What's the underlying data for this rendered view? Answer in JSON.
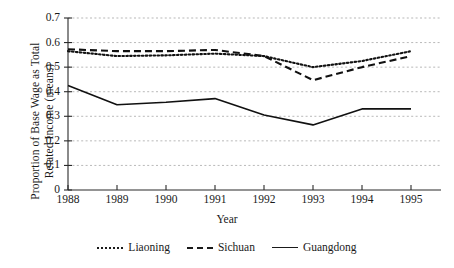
{
  "chart_data": {
    "type": "line",
    "title": "",
    "xlabel": "Year",
    "ylabel": "Proportion of Base Wage as Total Related Income (means)",
    "ylabel_line1": "Proportion of Base Wage as Total",
    "ylabel_line2": "Related Income (means)",
    "categories": [
      "1988",
      "1989",
      "1990",
      "1991",
      "1992",
      "1993",
      "1994",
      "1995"
    ],
    "x": [
      1988,
      1989,
      1990,
      1991,
      1992,
      1993,
      1994,
      1995
    ],
    "xlim": [
      1988,
      1995
    ],
    "ylim": [
      0,
      0.7
    ],
    "yticks": [
      "0",
      "0.1",
      "0.2",
      "0.3",
      "0.4",
      "0.5",
      "0.6",
      "0.7"
    ],
    "ytick_values": [
      0,
      0.1,
      0.2,
      0.3,
      0.4,
      0.5,
      0.6,
      0.7
    ],
    "grid": true,
    "grid_axis": "y",
    "legend_position": "bottom-center",
    "series": [
      {
        "name": "Liaoning",
        "style": "dotted",
        "color": "#111111",
        "values": [
          0.565,
          0.545,
          0.548,
          0.555,
          0.545,
          0.5,
          0.525,
          0.565
        ]
      },
      {
        "name": "Sichuan",
        "style": "dashed",
        "color": "#111111",
        "values": [
          0.573,
          0.565,
          0.565,
          0.57,
          0.545,
          0.447,
          0.5,
          0.545
        ]
      },
      {
        "name": "Guangdong",
        "style": "solid",
        "color": "#111111",
        "values": [
          0.425,
          0.347,
          0.357,
          0.372,
          0.305,
          0.265,
          0.33,
          0.33
        ]
      }
    ]
  }
}
